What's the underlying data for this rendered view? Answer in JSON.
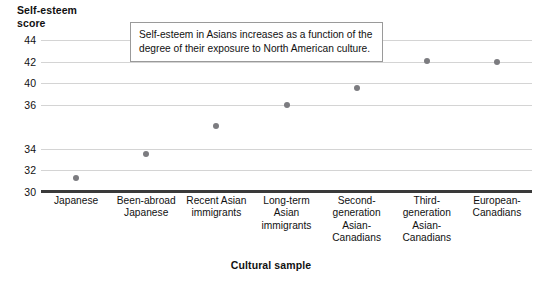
{
  "axes": {
    "y_title": "Self-esteem\nscore",
    "x_title": "Cultural sample"
  },
  "annotation": {
    "line1": "Self-esteem in Asians increases as a function of the",
    "line2": "degree of their exposure to North American culture."
  },
  "y_ticks": [
    {
      "label": "44",
      "value": 44
    },
    {
      "label": "42",
      "value": 42
    },
    {
      "label": "40",
      "value": 40
    },
    {
      "label": "36",
      "value": 38
    },
    {
      "label": "34",
      "value": 34
    },
    {
      "label": "32",
      "value": 32
    },
    {
      "label": "30",
      "value": 30
    }
  ],
  "colors": {
    "point": "#7c7c80",
    "gridline": "#d4d4d4",
    "axis": "#3a3a3a",
    "annotation_border": "#9a9a9a",
    "text": "#111111",
    "background": "#ffffff"
  },
  "chart_data": {
    "type": "scatter",
    "title": "",
    "subtitle": "",
    "xlabel": "Cultural sample",
    "ylabel": "Self-esteem score",
    "categories": [
      "Japanese",
      "Been-abroad Japanese",
      "Recent Asian immigrants",
      "Long-term Asian immigrants",
      "Second-generation Asian-Canadians",
      "Third-generation Asian-Canadians",
      "European-Canadians"
    ],
    "category_lines": [
      [
        "Japanese"
      ],
      [
        "Been-abroad",
        "Japanese"
      ],
      [
        "Recent Asian",
        "immigrants"
      ],
      [
        "Long-term",
        "Asian",
        "immigrants"
      ],
      [
        "Second-",
        "generation",
        "Asian-",
        "Canadians"
      ],
      [
        "Third-",
        "generation",
        "Asian-",
        "Canadians"
      ],
      [
        "European-",
        "Canadians"
      ]
    ],
    "values": [
      31.3,
      33.5,
      36.1,
      38.0,
      39.6,
      42.1,
      42.0
    ],
    "ylim": [
      30,
      44
    ],
    "ytick_values": [
      30,
      32,
      34,
      38,
      40,
      42,
      44
    ],
    "ytick_labels": [
      "30",
      "32",
      "34",
      "36",
      "40",
      "42",
      "44"
    ],
    "grid": true,
    "grid_axis": "y",
    "legend": false,
    "annotations": [
      "Self-esteem in Asians increases as a function of the degree of their exposure to North American culture."
    ]
  }
}
